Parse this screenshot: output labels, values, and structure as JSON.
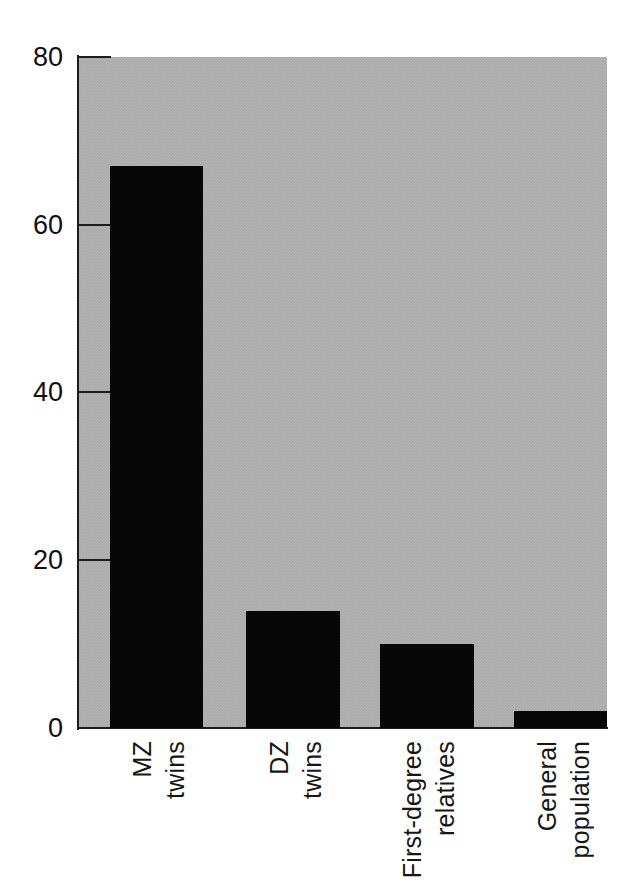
{
  "chart_data": {
    "type": "bar",
    "title": "",
    "subtitle": "",
    "xlabel": "",
    "ylabel": "",
    "categories": [
      "MZ twins",
      "DZ twins",
      "First-degree relatives",
      "General population"
    ],
    "category_lines": [
      [
        "MZ",
        "twins"
      ],
      [
        "DZ",
        "twins"
      ],
      [
        "First-degree",
        "relatives"
      ],
      [
        "General",
        "population"
      ]
    ],
    "values": [
      67,
      14,
      10,
      2
    ],
    "ylim": [
      0,
      80
    ],
    "yticks": [
      0,
      20,
      40,
      60,
      80
    ],
    "ytick_labels": [
      "0",
      "20",
      "40",
      "60",
      "80"
    ],
    "grid": false,
    "legend": null,
    "legend_position": "none",
    "orientation": "vertical",
    "label_rotation": 90,
    "colors": {
      "bar": "#070707",
      "plot_background": "#a9a9a9",
      "figure_background": "#ffffff",
      "axis": "#1c1c1c",
      "text": "#111111"
    }
  }
}
